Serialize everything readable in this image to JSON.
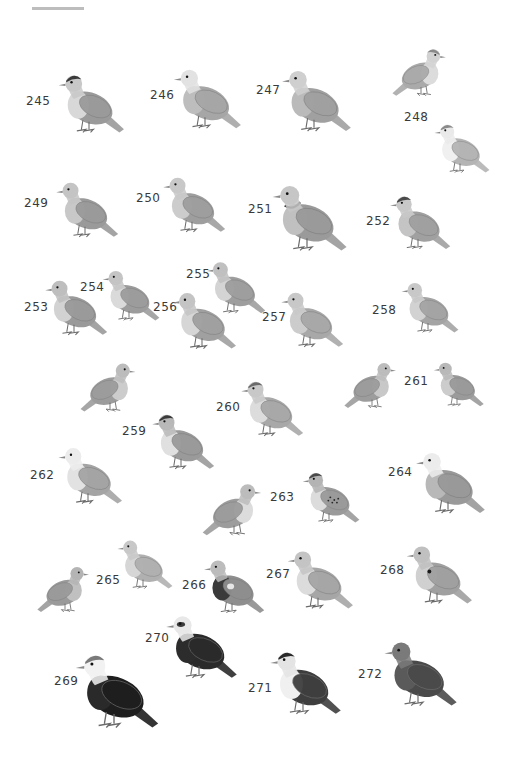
{
  "plate": {
    "description": "Grayscale illustration plate of pigeons and doves",
    "birds": [
      {
        "number": "245",
        "label_x": 26,
        "label_y": 94,
        "bird_x": 42,
        "bird_y": 64,
        "w": 94,
        "h": 76,
        "facing": "left",
        "body": "#9a9a9a",
        "head": "#c8c8c8",
        "cap": "#3b3b3b",
        "breast": "#d8d8d8"
      },
      {
        "number": "246",
        "label_x": 150,
        "label_y": 88,
        "bird_x": 166,
        "bird_y": 58,
        "w": 78,
        "h": 78,
        "facing": "left",
        "body": "#a6a6a6",
        "head": "#e2e2e2",
        "cap": "",
        "breast": "#bdbdbd"
      },
      {
        "number": "247",
        "label_x": 256,
        "label_y": 83,
        "bird_x": 274,
        "bird_y": 59,
        "w": 80,
        "h": 80,
        "facing": "left",
        "body": "#a0a0a0",
        "head": "#cfcfcf",
        "cap": "",
        "breast": "#bababa"
      },
      {
        "number": "248a",
        "label_x": 0,
        "label_y": 0,
        "bird_x": 383,
        "bird_y": 40,
        "w": 76,
        "h": 62,
        "facing": "right",
        "body": "#aaaaaa",
        "head": "#d2d2d2",
        "cap": "#8a8a8a",
        "breast": "#dcdcdc"
      },
      {
        "number": "248",
        "label_x": 404,
        "label_y": 110,
        "bird_x": 428,
        "bird_y": 113,
        "w": 64,
        "h": 68,
        "facing": "left",
        "body": "#b4b4b4",
        "head": "#eaeaea",
        "cap": "#8a8a8a",
        "breast": "#f0f0f0"
      },
      {
        "number": "249",
        "label_x": 24,
        "label_y": 196,
        "bird_x": 44,
        "bird_y": 172,
        "w": 82,
        "h": 72,
        "facing": "left",
        "body": "#9a9a9a",
        "head": "#c4c4c4",
        "cap": "",
        "breast": "#c8c8c8"
      },
      {
        "number": "250",
        "label_x": 136,
        "label_y": 191,
        "bird_x": 152,
        "bird_y": 167,
        "w": 80,
        "h": 72,
        "facing": "left",
        "body": "#9e9e9e",
        "head": "#c8c8c8",
        "cap": "",
        "breast": "#cccccc"
      },
      {
        "number": "251",
        "label_x": 248,
        "label_y": 202,
        "bird_x": 262,
        "bird_y": 173,
        "w": 90,
        "h": 86,
        "facing": "left",
        "body": "#9a9a9a",
        "head": "#c6c6c6",
        "cap": "",
        "breast": "#c0c0c0",
        "collar": "#3a3a3a"
      },
      {
        "number": "252",
        "label_x": 366,
        "label_y": 214,
        "bird_x": 376,
        "bird_y": 186,
        "w": 84,
        "h": 70,
        "facing": "left",
        "body": "#a0a0a0",
        "head": "#c8c8c8",
        "cap": "#4a4a4a",
        "breast": "#c4c4c4"
      },
      {
        "number": "253",
        "label_x": 24,
        "label_y": 300,
        "bird_x": 36,
        "bird_y": 270,
        "w": 76,
        "h": 72,
        "facing": "left",
        "body": "#9a9a9a",
        "head": "#bebebe",
        "cap": "",
        "breast": "#d2d2d2"
      },
      {
        "number": "254",
        "label_x": 80,
        "label_y": 280,
        "bird_x": 96,
        "bird_y": 255,
        "w": 66,
        "h": 78,
        "facing": "left",
        "body": "#9c9c9c",
        "head": "#c4c4c4",
        "cap": "",
        "breast": "#dadada"
      },
      {
        "number": "255",
        "label_x": 186,
        "label_y": 267,
        "bird_x": 200,
        "bird_y": 244,
        "w": 68,
        "h": 84,
        "facing": "left",
        "body": "#9e9e9e",
        "head": "#c0c0c0",
        "cap": "",
        "breast": "#d4d4d4"
      },
      {
        "number": "256",
        "label_x": 153,
        "label_y": 300,
        "bird_x": 164,
        "bird_y": 282,
        "w": 76,
        "h": 74,
        "facing": "left",
        "body": "#a0a0a0",
        "head": "#c4c4c4",
        "cap": "",
        "breast": "#d6d6d6"
      },
      {
        "number": "257",
        "label_x": 262,
        "label_y": 310,
        "bird_x": 274,
        "bird_y": 282,
        "w": 72,
        "h": 72,
        "facing": "left",
        "body": "#a8a8a8",
        "head": "#c8c8c8",
        "cap": "",
        "breast": "#cccccc"
      },
      {
        "number": "258",
        "label_x": 372,
        "label_y": 303,
        "bird_x": 380,
        "bird_y": 273,
        "w": 96,
        "h": 66,
        "facing": "left",
        "body": "#a4a4a4",
        "head": "#c8c8c8",
        "cap": "",
        "breast": "#d2d2d2"
      },
      {
        "number": "259a",
        "label_x": 0,
        "label_y": 0,
        "bird_x": 72,
        "bird_y": 354,
        "w": 76,
        "h": 64,
        "facing": "right",
        "body": "#9c9c9c",
        "head": "#bcbcbc",
        "cap": "",
        "breast": "#cccccc"
      },
      {
        "number": "259",
        "label_x": 122,
        "label_y": 424,
        "bird_x": 144,
        "bird_y": 404,
        "w": 74,
        "h": 72,
        "facing": "left",
        "body": "#9a9a9a",
        "head": "#b8b8b8",
        "cap": "#3a3a3a",
        "breast": "#e0e0e0"
      },
      {
        "number": "260",
        "label_x": 216,
        "label_y": 400,
        "bird_x": 232,
        "bird_y": 371,
        "w": 76,
        "h": 72,
        "facing": "left",
        "body": "#a8a8a8",
        "head": "#c8c8c8",
        "cap": "#6a6a6a",
        "breast": "#dcdcdc"
      },
      {
        "number": "261a",
        "label_x": 0,
        "label_y": 0,
        "bird_x": 341,
        "bird_y": 354,
        "w": 62,
        "h": 60,
        "facing": "right",
        "body": "#9c9c9c",
        "head": "#bcbcbc",
        "cap": "",
        "breast": "#c8c8c8"
      },
      {
        "number": "261",
        "label_x": 404,
        "label_y": 374,
        "bird_x": 425,
        "bird_y": 354,
        "w": 64,
        "h": 58,
        "facing": "left",
        "body": "#9a9a9a",
        "head": "#b8b8b8",
        "cap": "",
        "breast": "#cccccc"
      },
      {
        "number": "262",
        "label_x": 30,
        "label_y": 468,
        "bird_x": 44,
        "bird_y": 437,
        "w": 88,
        "h": 74,
        "facing": "left",
        "body": "#a4a4a4",
        "head": "#ececec",
        "cap": "",
        "breast": "#e2e2e2"
      },
      {
        "number": "263a",
        "label_x": 0,
        "label_y": 0,
        "bird_x": 200,
        "bird_y": 473,
        "w": 68,
        "h": 70,
        "facing": "right",
        "body": "#9c9c9c",
        "head": "#bcbcbc",
        "cap": "",
        "breast": "#dcdcdc"
      },
      {
        "number": "263",
        "label_x": 270,
        "label_y": 490,
        "bird_x": 290,
        "bird_y": 463,
        "w": 78,
        "h": 66,
        "facing": "left",
        "body": "#9a9a9a",
        "head": "#b4b4b4",
        "cap": "#4a4a4a",
        "breast": "#dcdcdc",
        "spots": true
      },
      {
        "number": "264",
        "label_x": 388,
        "label_y": 465,
        "bird_x": 408,
        "bird_y": 440,
        "w": 80,
        "h": 82,
        "facing": "left",
        "body": "#999999",
        "head": "#ececec",
        "cap": "",
        "breast": "#b8b8b8"
      },
      {
        "number": "265a",
        "label_x": 0,
        "label_y": 0,
        "bird_x": 34,
        "bird_y": 558,
        "w": 62,
        "h": 60,
        "facing": "right",
        "body": "#9a9a9a",
        "head": "#b4b4b4",
        "cap": "",
        "breast": "#c0c0c0"
      },
      {
        "number": "265",
        "label_x": 96,
        "label_y": 573,
        "bird_x": 110,
        "bird_y": 531,
        "w": 66,
        "h": 64,
        "facing": "left",
        "body": "#b0b0b0",
        "head": "#c8c8c8",
        "cap": "",
        "breast": "#d6d6d6"
      },
      {
        "number": "266",
        "label_x": 182,
        "label_y": 578,
        "bird_x": 196,
        "bird_y": 550,
        "w": 72,
        "h": 70,
        "facing": "left",
        "body": "#8e8e8e",
        "head": "#bcbcbc",
        "cap": "",
        "breast": "#3a3a3a",
        "patch": "#e6e6e6"
      },
      {
        "number": "267",
        "label_x": 266,
        "label_y": 567,
        "bird_x": 280,
        "bird_y": 540,
        "w": 76,
        "h": 76,
        "facing": "left",
        "body": "#a6a6a6",
        "head": "#c4c4c4",
        "cap": "",
        "breast": "#dcdcdc"
      },
      {
        "number": "268",
        "label_x": 380,
        "label_y": 563,
        "bird_x": 396,
        "bird_y": 535,
        "w": 82,
        "h": 76,
        "facing": "left",
        "body": "#a0a0a0",
        "head": "#c0c0c0",
        "cap": "",
        "breast": "#d0d0d0",
        "neck_spot": "#1a1a1a"
      },
      {
        "number": "269",
        "label_x": 54,
        "label_y": 674,
        "bird_x": 66,
        "bird_y": 641,
        "w": 96,
        "h": 96,
        "facing": "left",
        "body": "#1e1e1e",
        "head": "#f2f2f2",
        "cap": "#7a7a7a",
        "breast": "#2a2a2a"
      },
      {
        "number": "270",
        "label_x": 145,
        "label_y": 631,
        "bird_x": 157,
        "bird_y": 604,
        "w": 84,
        "h": 82,
        "facing": "left",
        "body": "#2a2a2a",
        "head": "#e8e8e8",
        "cap": "",
        "mask": "#3a3a3a",
        "breast": "#2c2c2c"
      },
      {
        "number": "271",
        "label_x": 248,
        "label_y": 681,
        "bird_x": 262,
        "bird_y": 634,
        "w": 82,
        "h": 94,
        "facing": "left",
        "body": "#3e3e3e",
        "head": "#e4e4e4",
        "cap": "#2a2a2a",
        "breast": "#f0f0f0"
      },
      {
        "number": "272",
        "label_x": 358,
        "label_y": 667,
        "bird_x": 376,
        "bird_y": 630,
        "w": 84,
        "h": 84,
        "facing": "left",
        "body": "#4a4a4a",
        "head": "#7a7a7a",
        "cap": "",
        "breast": "#5a5a5a"
      }
    ]
  }
}
